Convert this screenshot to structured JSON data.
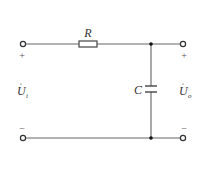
{
  "diagram": {
    "type": "RC low-pass filter circuit",
    "components": {
      "resistor": {
        "label": "R"
      },
      "capacitor": {
        "label": "C"
      }
    },
    "input": {
      "label": "U",
      "subscript": "i",
      "plus": "+",
      "minus": "−"
    },
    "output": {
      "label": "U",
      "subscript": "o",
      "plus": "+",
      "minus": "−"
    },
    "colors": {
      "wire": "#555555",
      "node": "#111111"
    }
  }
}
